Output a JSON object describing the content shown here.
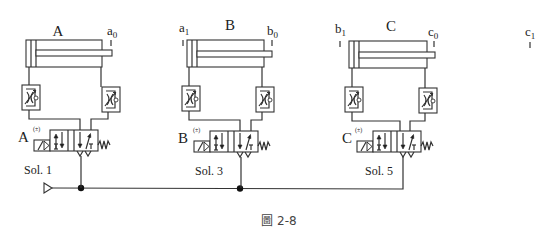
{
  "figure": {
    "caption": "圖 2-8"
  },
  "cylinders": [
    {
      "name": "A",
      "limit_switch_left": "",
      "limit_switch_right": "a0",
      "switch_right_sub": "0",
      "switch_right_base": "a"
    },
    {
      "name": "B",
      "limit_switch_left": "a1",
      "switch_left_base": "a",
      "switch_left_sub": "1",
      "switch_right_base": "b",
      "switch_right_sub": "0"
    },
    {
      "name": "C",
      "limit_switch_left": "b1",
      "switch_left_base": "b",
      "switch_left_sub": "1",
      "switch_right_base": "c",
      "switch_right_sub": "0"
    }
  ],
  "extra_switch": {
    "base": "c",
    "sub": "1"
  },
  "valves": [
    {
      "label": "A",
      "sign": "(±)",
      "solenoid": "Sol. 1"
    },
    {
      "label": "B",
      "sign": "(±)",
      "solenoid": "Sol. 3"
    },
    {
      "label": "C",
      "sign": "(±)",
      "solenoid": "Sol. 5"
    }
  ],
  "supply": {
    "symbol": "pressure-source-triangle"
  }
}
